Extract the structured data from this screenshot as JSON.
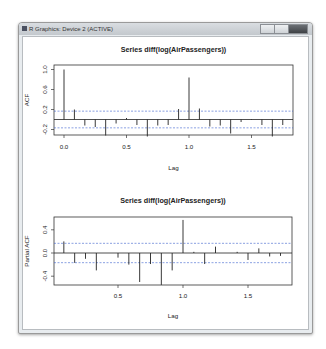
{
  "window": {
    "title": "R Graphics: Device 2 (ACTIVE)",
    "buttons": [
      "minimize",
      "maximize",
      "close"
    ]
  },
  "chart_data": [
    {
      "type": "bar",
      "subtype": "acf",
      "title": "Series  diff(log(AirPassengers))",
      "xlabel": "Lag",
      "ylabel": "ACF",
      "xticks": [
        "0.0",
        "0.5",
        "1.0",
        "1.5"
      ],
      "yticks": [
        "-0.2",
        "0.2",
        "0.6",
        "1.0"
      ],
      "ylim": [
        -0.4,
        1.05
      ],
      "xlim": [
        0,
        1.8
      ],
      "ci": 0.167,
      "x": [
        0,
        0.0833,
        0.1667,
        0.25,
        0.3333,
        0.4167,
        0.5,
        0.5833,
        0.6667,
        0.75,
        0.8333,
        0.9167,
        1.0,
        1.0833,
        1.1667,
        1.25,
        1.3333,
        1.4167,
        1.5,
        1.5833,
        1.6667,
        1.75
      ],
      "values": [
        1.0,
        0.2,
        -0.12,
        -0.15,
        -0.32,
        -0.08,
        0.03,
        -0.11,
        -0.34,
        -0.12,
        -0.11,
        0.21,
        0.84,
        0.22,
        -0.14,
        -0.12,
        -0.28,
        -0.05,
        0.01,
        -0.11,
        -0.34,
        -0.11
      ]
    },
    {
      "type": "bar",
      "subtype": "pacf",
      "title": "Series  diff(log(AirPassengers))",
      "xlabel": "Lag",
      "ylabel": "Partial ACF",
      "xticks": [
        "0.5",
        "1.0",
        "1.5"
      ],
      "yticks": [
        "-0.4",
        "0.0",
        "0.4"
      ],
      "ylim": [
        -0.58,
        0.6
      ],
      "xlim": [
        0.06,
        1.8
      ],
      "ci": 0.167,
      "x": [
        0.0833,
        0.1667,
        0.25,
        0.3333,
        0.4167,
        0.5,
        0.5833,
        0.6667,
        0.75,
        0.8333,
        0.9167,
        1.0,
        1.0833,
        1.1667,
        1.25,
        1.3333,
        1.4167,
        1.5,
        1.5833,
        1.6667,
        1.75
      ],
      "values": [
        0.2,
        -0.17,
        -0.1,
        -0.3,
        0.0,
        -0.08,
        -0.2,
        -0.5,
        -0.19,
        -0.55,
        -0.3,
        0.57,
        0.02,
        -0.19,
        0.11,
        0.0,
        0.02,
        -0.12,
        0.08,
        -0.06,
        -0.05
      ]
    }
  ]
}
